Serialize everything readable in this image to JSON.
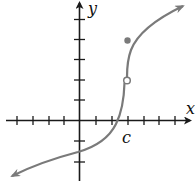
{
  "figure": {
    "type": "function graph with removable/jump discontinuity point",
    "axes": {
      "x_label": "x",
      "y_label": "y",
      "x_tick_count_left": 4,
      "x_tick_count_right": 6,
      "y_tick_count_above": 5,
      "y_tick_count_below": 2
    },
    "annotations": {
      "c_label": "c"
    },
    "points": {
      "open_circle": {
        "description": "hole on curve at x = c",
        "x_px": 127,
        "y_px": 80
      },
      "filled_dot": {
        "description": "function value at x = c, above the curve",
        "x_px": 128,
        "y_px": 40
      }
    },
    "colors": {
      "axis": "#1a1a1a",
      "curve": "#7a7a7a",
      "dot": "#7a7a7a",
      "background": "#ffffff"
    }
  }
}
